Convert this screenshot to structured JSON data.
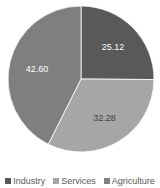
{
  "chart_data": {
    "type": "pie",
    "title": "",
    "categories": [
      "Industry",
      "Services",
      "Agriculture"
    ],
    "values": [
      25.12,
      32.28,
      42.6
    ],
    "colors": [
      "#595959",
      "#a6a6a6",
      "#7f7f7f"
    ],
    "label_colors": [
      "#ffffff",
      "#404040",
      "#ffffff"
    ],
    "labels": [
      "25.12",
      "32.28",
      "42.60"
    ],
    "start_angle_deg": 0,
    "direction": "clockwise",
    "legend_position": "bottom"
  },
  "legend": {
    "items": [
      {
        "label": "Industry",
        "color": "#595959"
      },
      {
        "label": "Services",
        "color": "#a6a6a6"
      },
      {
        "label": "Agriculture",
        "color": "#7f7f7f"
      }
    ]
  }
}
